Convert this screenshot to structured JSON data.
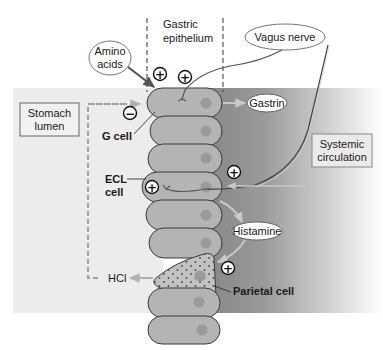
{
  "diagram": {
    "regions": {
      "epithelium_label_line1": "Gastric",
      "epithelium_label_line2": "epithelium",
      "lumen_label_line1": "Stomach",
      "lumen_label_line2": "lumen",
      "circulation_label_line1": "Systemic",
      "circulation_label_line2": "circulation"
    },
    "stimuli": {
      "amino_acids_line1": "Amino",
      "amino_acids_line2": "acids",
      "vagus_nerve": "Vagus nerve"
    },
    "cells": {
      "g_cell": "G cell",
      "ecl_cell_line1": "ECL",
      "ecl_cell_line2": "cell",
      "parietal_cell": "Parietal cell"
    },
    "mediators": {
      "gastrin": "Gastrin",
      "histamine": "Histamine",
      "hcl": "HCl"
    },
    "signs": {
      "plus": "+",
      "minus": "−"
    },
    "colors": {
      "lumen_bg": "#ececec",
      "circulation_dark": "#8a8a8a",
      "cell_fill": "#b4b4b4",
      "cell_stroke": "#3a3a3a",
      "nucleus": "#9a9a9a",
      "arrow_gray": "#a8a8a8",
      "dark_arrow": "#555555"
    }
  }
}
